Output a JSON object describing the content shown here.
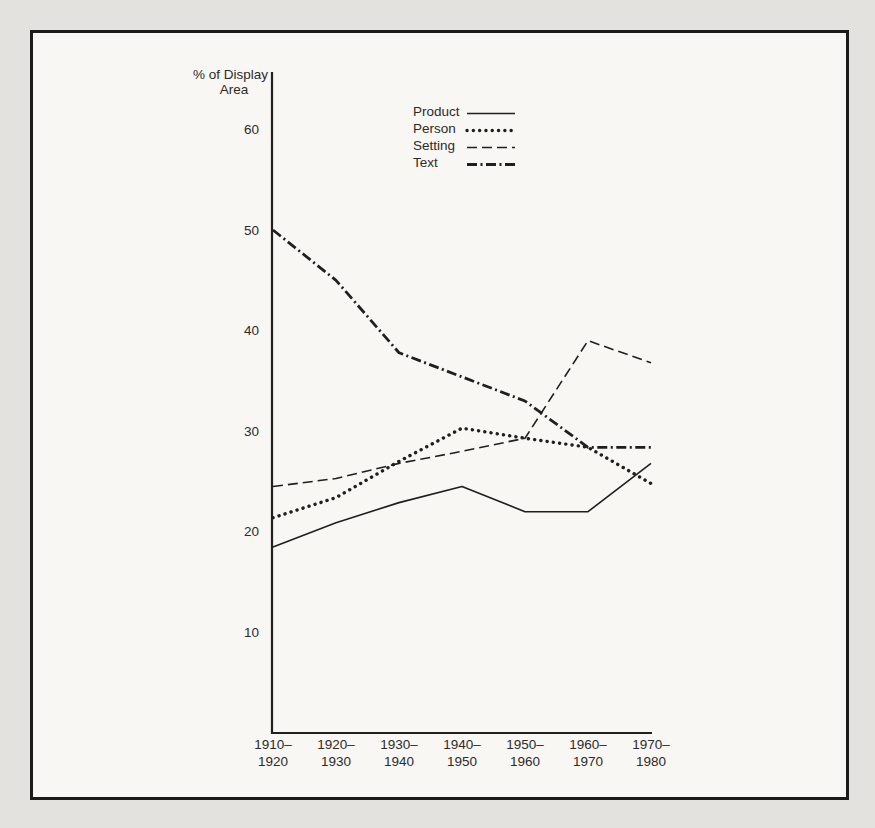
{
  "page": {
    "background_outside": "#e3e2df",
    "background_inside": "#f8f7f4",
    "frame_color": "#1b1b1b",
    "line_color": "#1f1f1f"
  },
  "chart_data": {
    "type": "line",
    "title": "",
    "ylabel": "% of Display Area",
    "ylabel_lines": [
      "% of Display",
      "Area"
    ],
    "xlabel": "",
    "grid": false,
    "legend_position": "top-center",
    "ylim": [
      0,
      65
    ],
    "yticks": [
      60,
      50,
      40,
      30,
      20,
      10
    ],
    "categories": [
      [
        "1910–",
        "1920"
      ],
      [
        "1920–",
        "1930"
      ],
      [
        "1930–",
        "1940"
      ],
      [
        "1940–",
        "1950"
      ],
      [
        "1950–",
        "1960"
      ],
      [
        "1960–",
        "1970"
      ],
      [
        "1970–",
        "1980"
      ]
    ],
    "series": [
      {
        "name": "Product",
        "style": "solid",
        "values": [
          18.5,
          20.9,
          22.9,
          24.5,
          22.0,
          22.0,
          26.8
        ]
      },
      {
        "name": "Person",
        "style": "dotted",
        "values": [
          21.4,
          23.4,
          27.0,
          30.3,
          29.3,
          28.4,
          24.8
        ]
      },
      {
        "name": "Setting",
        "style": "dashed",
        "values": [
          24.5,
          25.3,
          26.8,
          28.0,
          29.3,
          39.0,
          36.8
        ]
      },
      {
        "name": "Text",
        "style": "dashdot",
        "values": [
          50.0,
          45.0,
          37.8,
          35.4,
          33.0,
          28.4,
          28.4
        ]
      }
    ]
  }
}
